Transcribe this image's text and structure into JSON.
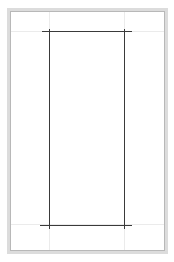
{
  "canvas": {
    "width": 174,
    "height": 262,
    "background": "#ffffff"
  },
  "colors": {
    "frame_outer": "#dcdcdc",
    "frame_inner": "#b8b8b8",
    "guides": "#ebebeb",
    "lines": "#3a3a3a"
  },
  "guides": {
    "horizontal_y": [
      31,
      224
    ],
    "vertical_x": [
      49,
      124
    ]
  },
  "rectangle": {
    "left": 49,
    "top": 31,
    "right": 124,
    "bottom": 224
  }
}
